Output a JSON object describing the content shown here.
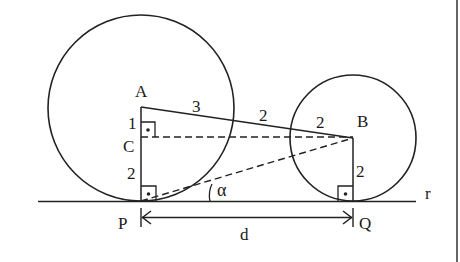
{
  "diagram": {
    "type": "geometry",
    "colors": {
      "ink": "#222222",
      "background": "#ffffff"
    },
    "points": {
      "A": "A",
      "B": "B",
      "C": "C",
      "P": "P",
      "Q": "Q"
    },
    "line_label": "r",
    "segment_labels": {
      "AC": "1",
      "CP": "2",
      "A_to_leftcircle": "3",
      "between_circles": "2",
      "B_radius_along_AB": "2",
      "BQ": "2"
    },
    "angle_label": "α",
    "distance_label": "d",
    "circles": [
      {
        "center": "A",
        "radius_label": "3"
      },
      {
        "center": "B",
        "radius_label": "2"
      }
    ]
  }
}
